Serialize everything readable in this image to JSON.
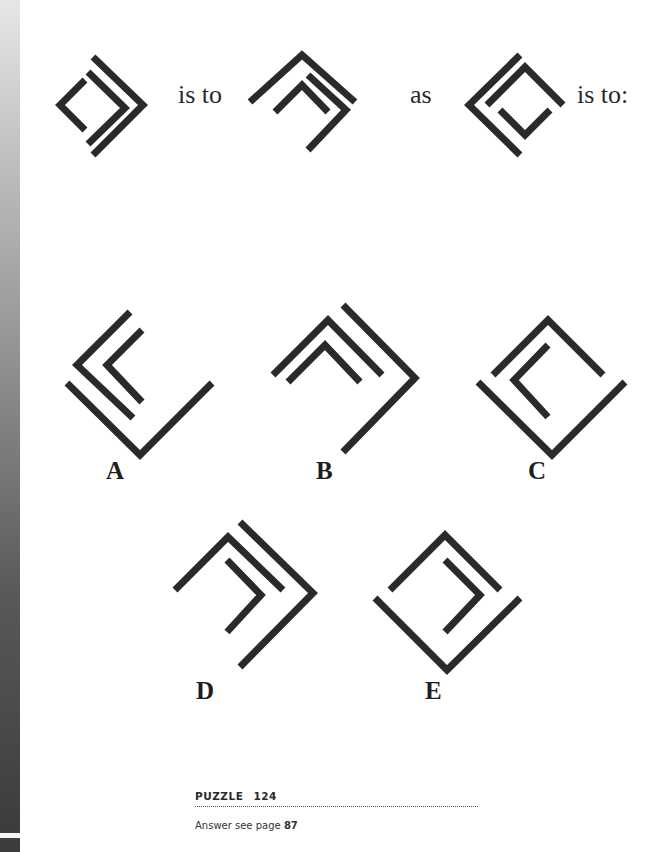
{
  "page": {
    "side_bar_color_top": "#e6e6e6",
    "side_bar_color_bottom": "#3c3c3c",
    "ink_color": "#2a2a2a"
  },
  "question": {
    "word_1": "is to",
    "word_2": "as",
    "word_3": "is to:"
  },
  "figures": {
    "given": [
      {
        "name": "figure-1",
        "shapes": [
          "small left bracket",
          "middle right chevron",
          "outer right chevron"
        ]
      },
      {
        "name": "figure-2",
        "shapes": [
          "outer up chevron",
          "inner up chevron",
          "right chevron"
        ]
      },
      {
        "name": "figure-3",
        "shapes": [
          "outer left chevron",
          "up chevron",
          "down chevron"
        ]
      }
    ],
    "options": [
      {
        "label": "A"
      },
      {
        "label": "B"
      },
      {
        "label": "C"
      },
      {
        "label": "D"
      },
      {
        "label": "E"
      }
    ]
  },
  "footer": {
    "puzzle_word": "PUZZLE",
    "puzzle_number": "124",
    "answer_prefix": "Answer see page",
    "answer_page": "87"
  }
}
